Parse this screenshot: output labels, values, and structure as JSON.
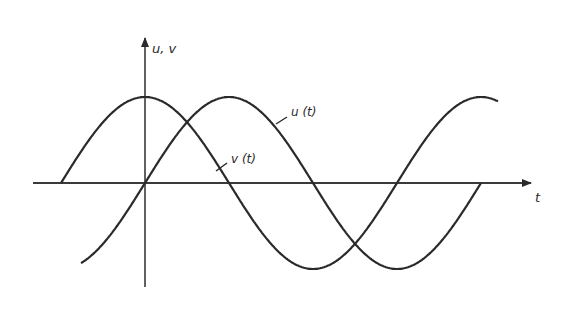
{
  "diagram": {
    "type": "phase-shifted sinusoids",
    "axes": {
      "y_label": "u, v",
      "x_label": "t"
    },
    "curves": [
      {
        "id": "u",
        "label": "u (t)",
        "shape": "sine",
        "description": "passes through origin, peaks a quarter period later"
      },
      {
        "id": "v",
        "label": "v (t)",
        "shape": "cosine",
        "description": "peaks at t = 0, leads u(t) by a quarter period"
      }
    ],
    "colors": {
      "ink": "#2a2a2a",
      "background": "#ffffff"
    }
  },
  "chart_data": {
    "type": "line",
    "title": "",
    "xlabel": "t",
    "ylabel": "u, v",
    "grid": false,
    "legend_position": "inline labels",
    "series": [
      {
        "name": "u (t)",
        "function": "sin(t)",
        "x_range_periods": [
          -0.19,
          1.0
        ]
      },
      {
        "name": "v (t)",
        "function": "cos(t)",
        "x_range_periods": [
          -0.25,
          1.05
        ]
      }
    ],
    "phase_difference": "90 degrees (v leads u)"
  }
}
